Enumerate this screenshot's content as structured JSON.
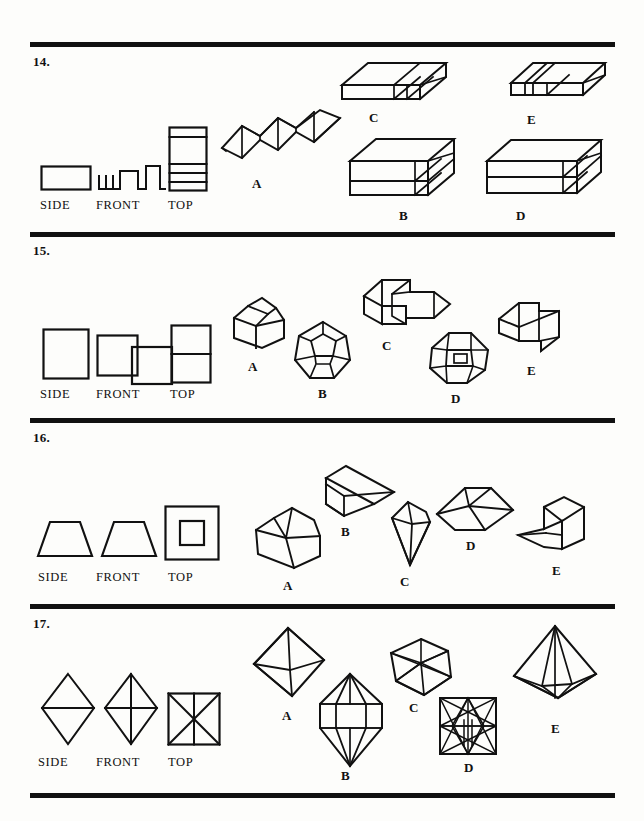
{
  "page": {
    "kind": "spatial-reasoning-test-page",
    "width": 644,
    "height": 821,
    "background_color": "#fdfdfb",
    "ink_color": "#111111"
  },
  "rules": [
    {
      "name": "rule-top",
      "y": 42
    },
    {
      "name": "rule-after-q14",
      "y": 232
    },
    {
      "name": "rule-after-q15",
      "y": 418
    },
    {
      "name": "rule-after-q16",
      "y": 604
    },
    {
      "name": "rule-bottom",
      "y": 793
    }
  ],
  "view_captions": {
    "side": "SIDE",
    "front": "FRONT",
    "top": "TOP"
  },
  "questions": [
    {
      "number": "14.",
      "views": [
        {
          "caption": "SIDE",
          "shape": "rectangle-plain"
        },
        {
          "caption": "FRONT",
          "shape": "square-wave-step-profile"
        },
        {
          "caption": "TOP",
          "shape": "tall-rectangle-five-bands"
        }
      ],
      "options": [
        {
          "label": "A",
          "shape": "corrugated-zigzag-sheet"
        },
        {
          "label": "B",
          "shape": "tall-slab-with-end-cells"
        },
        {
          "label": "C",
          "shape": "flat-slab-with-end-cells"
        },
        {
          "label": "D",
          "shape": "long-slab-two-layers-end-cells"
        },
        {
          "label": "E",
          "shape": "flat-slab-with-groove"
        }
      ]
    },
    {
      "number": "15.",
      "views": [
        {
          "caption": "SIDE",
          "shape": "rectangle-upright"
        },
        {
          "caption": "FRONT",
          "shape": "two-offset-squares"
        },
        {
          "caption": "TOP",
          "shape": "rectangle-split-horizontally"
        }
      ],
      "options": [
        {
          "label": "A",
          "shape": "house-pentagonal-prism"
        },
        {
          "label": "B",
          "shape": "dodecahedron"
        },
        {
          "label": "C",
          "shape": "offset-twin-blocks"
        },
        {
          "label": "D",
          "shape": "octagon-with-inner-square"
        },
        {
          "label": "E",
          "shape": "stepped-twin-cubes"
        }
      ]
    },
    {
      "number": "16.",
      "views": [
        {
          "caption": "SIDE",
          "shape": "trapezoid"
        },
        {
          "caption": "FRONT",
          "shape": "trapezoid"
        },
        {
          "caption": "TOP",
          "shape": "square-within-square"
        }
      ],
      "options": [
        {
          "label": "A",
          "shape": "cube-with-ridge"
        },
        {
          "label": "B",
          "shape": "wedge-block"
        },
        {
          "label": "C",
          "shape": "inverted-pyramid"
        },
        {
          "label": "D",
          "shape": "truncated-pyramid-frustum"
        },
        {
          "label": "E",
          "shape": "cube-with-wedge"
        }
      ]
    },
    {
      "number": "17.",
      "views": [
        {
          "caption": "SIDE",
          "shape": "rhombus-with-horizontal-bisector"
        },
        {
          "caption": "FRONT",
          "shape": "rhombus-with-both-diagonals"
        },
        {
          "caption": "TOP",
          "shape": "square-with-x-and-vertical"
        }
      ],
      "options": [
        {
          "label": "A",
          "shape": "octahedron"
        },
        {
          "label": "B",
          "shape": "bipyramid-with-prism-band"
        },
        {
          "label": "C",
          "shape": "icosahedron"
        },
        {
          "label": "D",
          "shape": "square-with-star-pattern"
        },
        {
          "label": "E",
          "shape": "tall-bipyramid"
        }
      ]
    }
  ]
}
